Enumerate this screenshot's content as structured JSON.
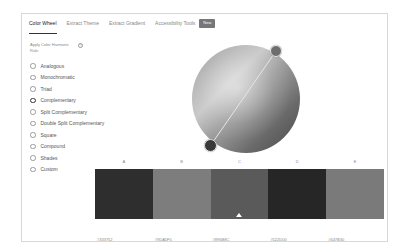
{
  "tabs": [
    {
      "label": "Color Wheel",
      "active": true
    },
    {
      "label": "Extract Theme",
      "active": false
    },
    {
      "label": "Extract Gradient",
      "active": false
    },
    {
      "label": "Accessibility Tools",
      "active": false
    }
  ],
  "badge": "New",
  "harmony": {
    "label": "Apply Color Harmonic Rule",
    "help_icon": "?",
    "options": [
      {
        "label": "Analogous",
        "checked": false
      },
      {
        "label": "Monochromatic",
        "checked": false
      },
      {
        "label": "Triad",
        "checked": false
      },
      {
        "label": "Complementary",
        "checked": true
      },
      {
        "label": "Split Complementary",
        "checked": false
      },
      {
        "label": "Double Split Complementary",
        "checked": false
      },
      {
        "label": "Square",
        "checked": false
      },
      {
        "label": "Compound",
        "checked": false
      },
      {
        "label": "Shades",
        "checked": false
      },
      {
        "label": "Custom",
        "checked": false
      }
    ]
  },
  "swatches": [
    {
      "letter": "A",
      "hex": "#333752",
      "color": "#2e2e2e"
    },
    {
      "letter": "B",
      "hex": "#9DA5F5",
      "color": "#7d7d7d"
    },
    {
      "letter": "C",
      "hex": "#896B8C",
      "color": "#5a5a5a",
      "selected": true
    },
    {
      "letter": "D",
      "hex": "#522D00",
      "color": "#262626"
    },
    {
      "letter": "E",
      "hex": "#647B30",
      "color": "#7a7a7a"
    }
  ]
}
